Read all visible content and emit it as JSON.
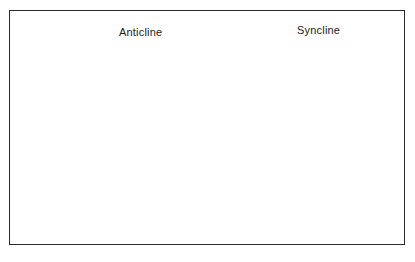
{
  "figure": {
    "background_color": "#ffffff",
    "border_color": "#2b2b2b",
    "frame": {
      "x": 9,
      "y": 10,
      "width": 396,
      "height": 235
    }
  },
  "labels": [
    {
      "id": "anticline",
      "text": "Anticline",
      "x": 119,
      "y": 26,
      "leader": {
        "type": "horizontal",
        "x1": 172,
        "y1": 34,
        "x2": 219,
        "y2": 34
      }
    },
    {
      "id": "syncline",
      "text": "Syncline",
      "x": 297,
      "y": 24,
      "leader": {
        "type": "vertical",
        "x1": 328,
        "y1": 40,
        "x2": 328,
        "y2": 85
      }
    }
  ],
  "strata": [
    {
      "name": "surface-layer",
      "description": "dark gray topmost rock unit forming the land surface",
      "pattern": "solid-shaded",
      "color": "#8d8d8d"
    },
    {
      "name": "laminated-layer",
      "description": "thin horizontally laminated bedded unit",
      "pattern": "horizontal-lines",
      "color": "#b9b6ae"
    },
    {
      "name": "limestone-layer",
      "description": "light brick-patterned limestone unit",
      "pattern": "brick",
      "color": "#e8e6df"
    },
    {
      "name": "basement-layer",
      "description": "lowest unit with dash hatch metamorphic texture",
      "pattern": "dash-hatch",
      "color": "#b4b2ab"
    }
  ],
  "structures": [
    {
      "name": "anticline",
      "type": "upfold",
      "crest_x": 225
    },
    {
      "name": "syncline",
      "type": "downfold",
      "trough_x": 330
    }
  ],
  "colors": {
    "top_light": "#d8d8d8",
    "top_dark": "#767676",
    "side_light": "#cfccc5",
    "side_dark": "#8a8780",
    "outline": "#3a3a3a",
    "text": "#1b1b1b"
  }
}
